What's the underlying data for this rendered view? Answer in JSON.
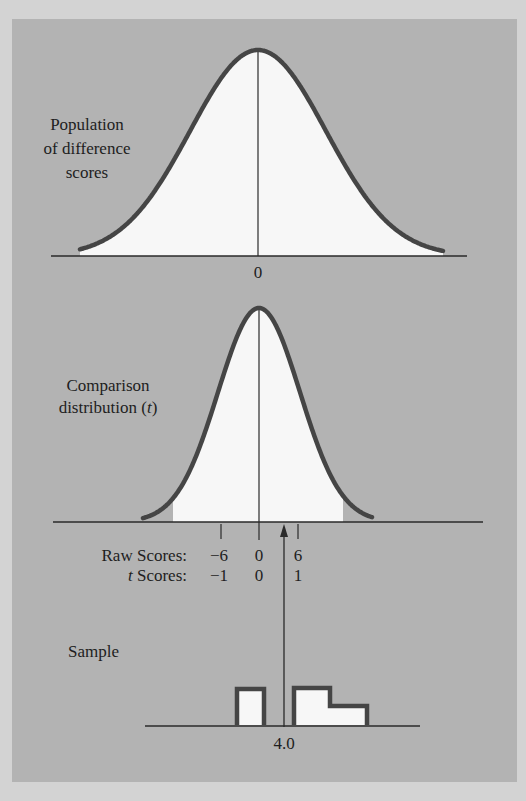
{
  "colors": {
    "outer_background": "#d3d3d3",
    "panel_background": "#b3b3b3",
    "curve_stroke": "#454545",
    "fill": "#f7f7f7",
    "line": "#2a2a2a",
    "text": "#1e1e1e"
  },
  "panels": {
    "population": {
      "label_lines": [
        "Population",
        "of difference",
        "scores"
      ],
      "axis_label": "0"
    },
    "comparison": {
      "label_line1": "Comparison",
      "label_line2_prefix": "distribution (",
      "label_line2_italic": "t",
      "label_line2_suffix": ")",
      "raw_scores_label": "Raw Scores:",
      "t_scores_label_italic": "t",
      "t_scores_label_rest": " Scores:",
      "raw_ticks": [
        "−6",
        "0",
        "6"
      ],
      "t_ticks": [
        "−1",
        "0",
        "1"
      ]
    },
    "sample": {
      "label": "Sample",
      "mean_label": "4.0"
    }
  },
  "chart_data": [
    {
      "type": "area",
      "title": "Population of difference scores",
      "distribution": "normal",
      "mean": 0,
      "x_tick_labels": [
        "0"
      ],
      "center_line": true
    },
    {
      "type": "area",
      "title": "Comparison distribution (t)",
      "distribution": "t",
      "mean": 0,
      "raw_score_ticks": [
        -6,
        0,
        6
      ],
      "t_score_ticks": [
        -1,
        0,
        1
      ],
      "center_line": true,
      "arrow_marker_raw_score": 4.0
    },
    {
      "type": "bar",
      "title": "Sample",
      "bars": [
        {
          "x_start": -7.5,
          "x_end": -4.5,
          "relative_height": 2
        },
        {
          "x_start": -1.5,
          "x_end": 2.5,
          "relative_height": 2
        },
        {
          "x_start": 2.5,
          "x_end": 6.5,
          "relative_height": 1
        }
      ],
      "mean": 4.0,
      "mean_label": "4.0"
    }
  ]
}
